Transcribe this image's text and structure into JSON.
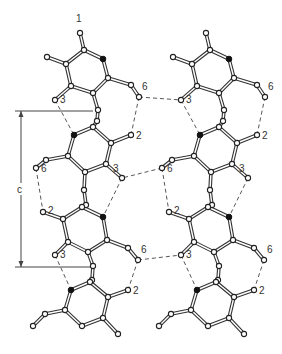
{
  "figure": {
    "type": "crystal-packing-diagram",
    "axis_marker": {
      "label": "c"
    },
    "atom_labels": {
      "one": "1",
      "two": "2",
      "three": "3",
      "six": "6"
    },
    "chains": [
      {
        "name": "left-chain",
        "molecules": 3
      },
      {
        "name": "right-chain",
        "molecules": 3
      }
    ],
    "colors": {
      "bond": "#333333",
      "atom_fill": "#ffffff",
      "nitrogen_fill": "#111111",
      "hbond": "#444444"
    }
  }
}
